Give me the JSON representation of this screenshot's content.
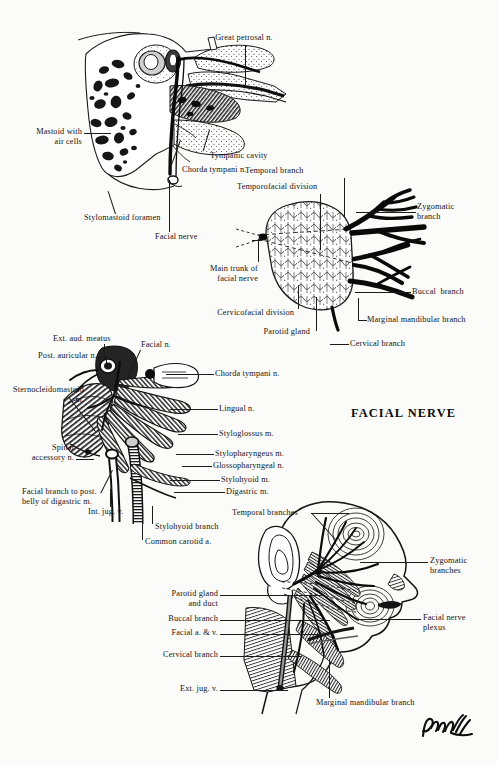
{
  "plate": {
    "title": "FACIAL NERVE",
    "signature": "Paterson",
    "background": "#fbfbf9",
    "ink": "#141414"
  },
  "figures": {
    "temporal_bone": {
      "name": "Temporal bone / middle ear cutaway",
      "labels": [
        {
          "id": "great-petrosal-n",
          "text": "Great petrosal n."
        },
        {
          "id": "mastoid-air-cells",
          "text": "Mastoid with\nair cells"
        },
        {
          "id": "tympanic-cavity",
          "text": "Tympanic cavity"
        },
        {
          "id": "chorda-tympani-n",
          "text": "Chorda tympani n."
        },
        {
          "id": "stylomastoid-foramen",
          "text": "Stylomastoid foramen"
        },
        {
          "id": "facial-nerve",
          "text": "Facial nerve"
        }
      ]
    },
    "parotid": {
      "name": "Parotid gland and facial nerve branching",
      "labels": [
        {
          "id": "temporal-branch",
          "text": "Temporal branch"
        },
        {
          "id": "temporofacial-division",
          "text": "Temporofacial division"
        },
        {
          "id": "zygomatic-branch",
          "text": "Zygomatic\nbranch"
        },
        {
          "id": "main-trunk-facial-nerve",
          "text": "Main trunk of\nfacial nerve"
        },
        {
          "id": "buccal-branch",
          "text": "Buccal  branch"
        },
        {
          "id": "cervicofacial-division",
          "text": "Cervicofacial division"
        },
        {
          "id": "marginal-mandibular-branch",
          "text": "Marginal mandibular branch"
        },
        {
          "id": "parotid-gland",
          "text": "Parotid gland"
        },
        {
          "id": "cervical-branch",
          "text": "Cervical branch"
        }
      ]
    },
    "deep_dissection": {
      "name": "Deep dissection of styloid region",
      "labels": [
        {
          "id": "ext-aud-meatus",
          "text": "Ext. aud. meatus"
        },
        {
          "id": "facial-n",
          "text": "Facial n."
        },
        {
          "id": "post-auricular-n",
          "text": "Post. auricular n."
        },
        {
          "id": "chorda-tympani-n2",
          "text": "Chorda tympani n."
        },
        {
          "id": "sternocleidomastoid-m",
          "text": "Sternocleidomastoid\nm."
        },
        {
          "id": "lingual-n",
          "text": "Lingual n."
        },
        {
          "id": "styloglossus-m",
          "text": "Styloglossus m."
        },
        {
          "id": "spinal-accessory-n",
          "text": "Spinal\naccessory n."
        },
        {
          "id": "stylopharyngeus-m",
          "text": "Stylopharyngeus m."
        },
        {
          "id": "glossopharyngeal-n",
          "text": "Glossopharyngeal n."
        },
        {
          "id": "stylohyoid-m",
          "text": "Stylohyoid m."
        },
        {
          "id": "digastric-m",
          "text": "Digastric m."
        },
        {
          "id": "facial-branch-digastric",
          "text": "Facial branch to post.\nbelly of digastric m."
        },
        {
          "id": "int-jug-v",
          "text": "Int. jug. v."
        },
        {
          "id": "stylohyoid-branch",
          "text": "Stylohyoid branch"
        },
        {
          "id": "common-carotid-a",
          "text": "Common carotid a."
        }
      ]
    },
    "face": {
      "name": "Lateral face with facial nerve distribution",
      "labels": [
        {
          "id": "temporal-branches",
          "text": "Temporal branches"
        },
        {
          "id": "zygomatic-branches",
          "text": "Zygomatic\nbranches"
        },
        {
          "id": "parotid-gland-and-duct",
          "text": "Parotid gland\nand duct"
        },
        {
          "id": "facial-nerve-plexus",
          "text": "Facial nerve\nplexus"
        },
        {
          "id": "buccal-branch2",
          "text": "Buccal branch"
        },
        {
          "id": "facial-a-v",
          "text": "Facial a. & v."
        },
        {
          "id": "cervical-branch2",
          "text": "Cervical branch"
        },
        {
          "id": "ext-jug-v",
          "text": "Ext. jug. v."
        },
        {
          "id": "marginal-mandibular-branch2",
          "text": "Marginal mandibular branch"
        }
      ]
    }
  }
}
